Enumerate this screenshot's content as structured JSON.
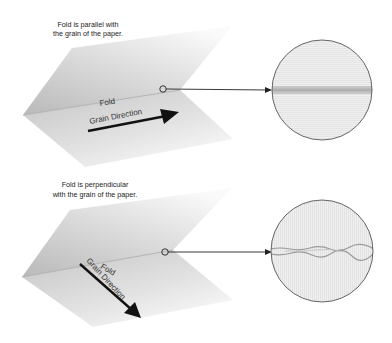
{
  "diagrams": [
    {
      "caption_line1": "Fold is parallel with",
      "caption_line2": "the grain of the paper.",
      "fold_label": "Fold",
      "grain_label": "Grain Direction",
      "detail": "smooth fold band"
    },
    {
      "caption_line1": "Fold is perpendicular",
      "caption_line2": "with the grain of the paper.",
      "fold_label": "Fold",
      "grain_label": "Grain Direction",
      "detail": "cracked fold band"
    }
  ],
  "colors": {
    "paper_dark": "#bdbdbd",
    "paper_light": "#f4f4f4",
    "ink": "#111111",
    "circle_fill": "#efefef",
    "circle_stroke": "#555555",
    "fold_band": "#b8b8b8"
  }
}
